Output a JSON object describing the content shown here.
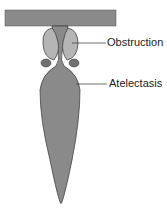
{
  "diagram": {
    "labels": {
      "obstruction": "Obstruction",
      "atelectasis": "Atelectasis"
    },
    "colors": {
      "airway": "#8a8a8a",
      "obstruction": "#b5b5b5",
      "outline": "#444444",
      "nodule": "#707070"
    }
  }
}
